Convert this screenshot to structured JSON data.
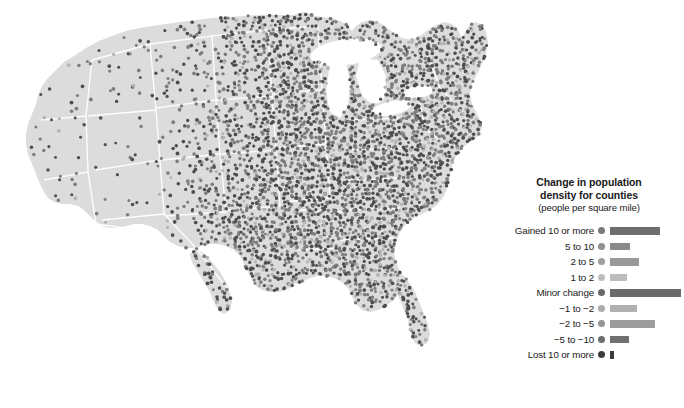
{
  "chart_data": {
    "type": "map",
    "title": "Change in population density for counties",
    "subtitle": "(people per square mile)",
    "region": "United States (contiguous 48 states)",
    "marker_type": "one dot per county",
    "categories": [
      "Gained 10 or more",
      "5 to 10",
      "2 to 5",
      "1 to 2",
      "Minor change",
      "−1 to −2",
      "−2 to −5",
      "−5 to −10",
      "Lost 10 or more"
    ],
    "values": [
      50,
      20,
      29,
      17,
      71,
      27,
      45,
      19,
      4
    ],
    "colors": [
      "#6e6e6e",
      "#8a8a8a",
      "#9a9a9a",
      "#bdbdbd",
      "#6a6a6a",
      "#b0b0b0",
      "#9c9c9c",
      "#707070",
      "#3c3c3c"
    ],
    "xlabel": "number of counties (relative bar length)",
    "ylabel": "change in population density",
    "legend_position": "right"
  },
  "map": {
    "land_color": "#dcdcdc",
    "border_color": "#ffffff",
    "background_color": "#ffffff",
    "dot_color_dark": "#4d4d4d",
    "dot_color_mid": "#7d7d7d",
    "dot_color_light": "#b4b4b4"
  },
  "legend": {
    "title_line1": "Change in population",
    "title_line2": "density for counties",
    "subtitle": "(people per square mile)",
    "rows": [
      {
        "label": "Gained 10 or more",
        "bar_width": 50,
        "color": "#6e6e6e",
        "dot_color": "#7a7a7a"
      },
      {
        "label": "5 to 10",
        "bar_width": 20,
        "color": "#8a8a8a",
        "dot_color": "#909090"
      },
      {
        "label": "2 to 5",
        "bar_width": 29,
        "color": "#9a9a9a",
        "dot_color": "#9e9e9e"
      },
      {
        "label": "1 to 2",
        "bar_width": 17,
        "color": "#bdbdbd",
        "dot_color": "#bdbdbd"
      },
      {
        "label": "Minor change",
        "bar_width": 71,
        "color": "#6a6a6a",
        "dot_color": "#6a6a6a"
      },
      {
        "label": "−1 to −2",
        "bar_width": 27,
        "color": "#b0b0b0",
        "dot_color": "#ababab"
      },
      {
        "label": "−2 to −5",
        "bar_width": 45,
        "color": "#9c9c9c",
        "dot_color": "#959595"
      },
      {
        "label": "−5 to −10",
        "bar_width": 19,
        "color": "#707070",
        "dot_color": "#6e6e6e"
      },
      {
        "label": "Lost 10 or more",
        "bar_width": 4,
        "color": "#3c3c3c",
        "dot_color": "#3c3c3c"
      }
    ]
  }
}
